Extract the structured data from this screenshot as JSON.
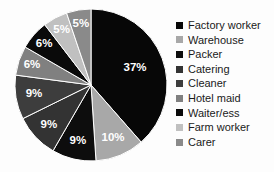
{
  "chart_data": {
    "type": "pie",
    "title": "",
    "xlabel": "",
    "ylabel": "",
    "legend_position": "right",
    "grid": false,
    "start_angle_deg": 0,
    "direction": "clockwise",
    "categories": [
      "Factory worker",
      "Warehouse",
      "Packer",
      "Catering",
      "Cleaner",
      "Hotel maid",
      "Waiter/ess",
      "Farm worker",
      "Carer"
    ],
    "values": [
      37,
      10,
      9,
      9,
      9,
      6,
      6,
      5,
      5
    ],
    "data_labels": [
      "37%",
      "10%",
      "9%",
      "9%",
      "9%",
      "6%",
      "6%",
      "5%",
      "5%"
    ],
    "colors": [
      "#070707",
      "#a8a8a8",
      "#0d0d0d",
      "#333333",
      "#3d3d3d",
      "#808080",
      "#0a0a0a",
      "#c0c0c0",
      "#8a8a8a"
    ],
    "slices": [
      {
        "label": "Factory worker",
        "value": 37,
        "data_label": "37%",
        "color": "#070707"
      },
      {
        "label": "Warehouse",
        "value": 10,
        "data_label": "10%",
        "color": "#a8a8a8"
      },
      {
        "label": "Packer",
        "value": 9,
        "data_label": "9%",
        "color": "#0d0d0d"
      },
      {
        "label": "Catering",
        "value": 9,
        "data_label": "9%",
        "color": "#333333"
      },
      {
        "label": "Cleaner",
        "value": 9,
        "data_label": "9%",
        "color": "#3d3d3d"
      },
      {
        "label": "Hotel maid",
        "value": 6,
        "data_label": "6%",
        "color": "#808080"
      },
      {
        "label": "Waiter/ess",
        "value": 6,
        "data_label": "6%",
        "color": "#0a0a0a"
      },
      {
        "label": "Farm worker",
        "value": 5,
        "data_label": "5%",
        "color": "#c0c0c0"
      },
      {
        "label": "Carer",
        "value": 5,
        "data_label": "5%",
        "color": "#8a8a8a"
      }
    ]
  },
  "legend": {
    "items": [
      {
        "label": "Factory worker",
        "color": "#070707"
      },
      {
        "label": "Warehouse",
        "color": "#a8a8a8"
      },
      {
        "label": "Packer",
        "color": "#0d0d0d"
      },
      {
        "label": "Catering",
        "color": "#333333"
      },
      {
        "label": "Cleaner",
        "color": "#3d3d3d"
      },
      {
        "label": "Hotel maid",
        "color": "#808080"
      },
      {
        "label": "Waiter/ess",
        "color": "#0a0a0a"
      },
      {
        "label": "Farm worker",
        "color": "#c0c0c0"
      },
      {
        "label": "Carer",
        "color": "#8a8a8a"
      }
    ]
  },
  "geometry": {
    "center_x": 77,
    "center_y": 77,
    "radius": 76
  }
}
